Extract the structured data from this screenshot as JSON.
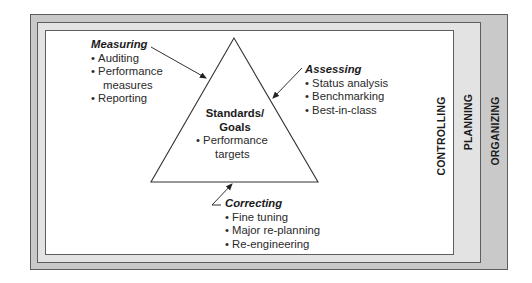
{
  "frames": {
    "organizing": {
      "label": "ORGANIZING",
      "color": "#c9c9c9"
    },
    "planning": {
      "label": "PLANNING",
      "color": "#e3e3e3"
    },
    "controlling": {
      "label": "CONTROLLING",
      "color": "#ffffff"
    }
  },
  "center": {
    "title_line1": "Standards/",
    "title_line2": "Goals",
    "items": [
      "Performance",
      "targets"
    ]
  },
  "measuring": {
    "title": "Measuring",
    "items": [
      "Auditing",
      "Performance",
      "measures",
      "Reporting"
    ]
  },
  "assessing": {
    "title": "Assessing",
    "items": [
      "Status analysis",
      "Benchmarking",
      "Best-in-class"
    ]
  },
  "correcting": {
    "title": "Correcting",
    "items": [
      "Fine tuning",
      "Major re-planning",
      "Re-engineering"
    ]
  },
  "colors": {
    "line": "#333333",
    "border": "#5e5e5e"
  }
}
